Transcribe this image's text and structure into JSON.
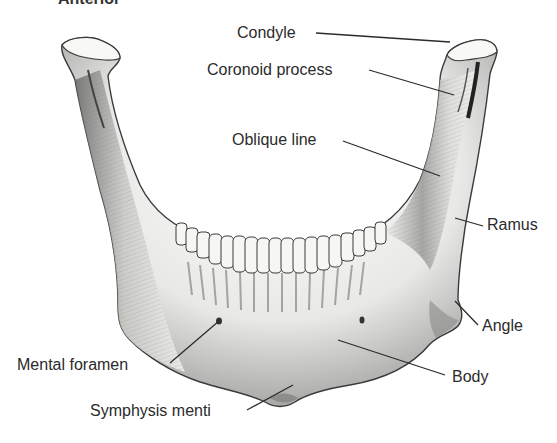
{
  "figure": {
    "title_fragment": "Anterior",
    "labels": [
      {
        "id": "condyle",
        "text": "Condyle"
      },
      {
        "id": "coronoid",
        "text": "Coronoid process"
      },
      {
        "id": "oblique",
        "text": "Oblique line"
      },
      {
        "id": "ramus",
        "text": "Ramus"
      },
      {
        "id": "angle",
        "text": "Angle"
      },
      {
        "id": "mental",
        "text": "Mental foramen"
      },
      {
        "id": "body",
        "text": "Body"
      },
      {
        "id": "symphysis",
        "text": "Symphysis menti"
      }
    ]
  },
  "colors": {
    "background": "#ffffff",
    "text": "#2b2b2b",
    "leader_line": "#2b2b2b",
    "bone_light": "#f4f4f2",
    "bone_shadow": "#8a8a8a",
    "bone_dark": "#3a3a3a"
  }
}
